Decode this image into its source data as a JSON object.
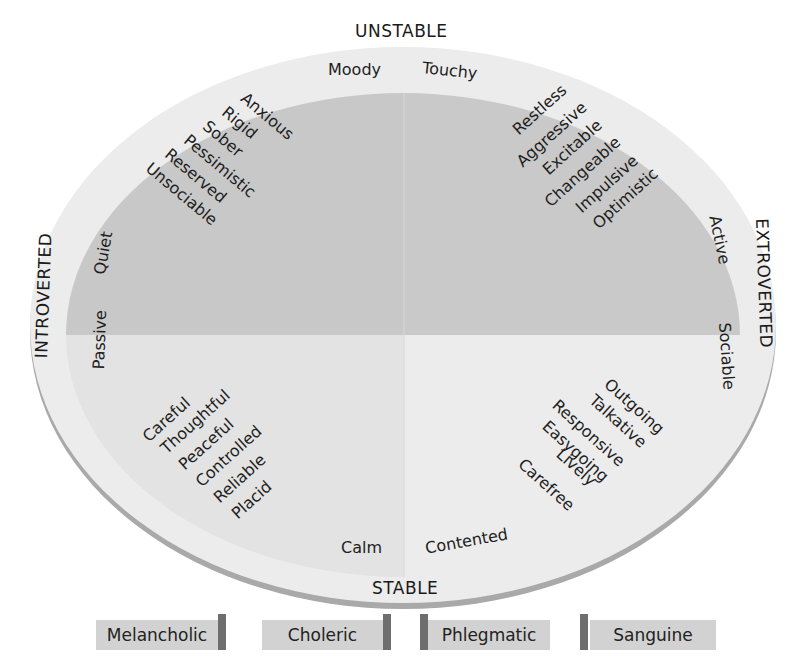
{
  "axes": {
    "top": "UNSTABLE",
    "bottom": "STABLE",
    "left": "INTROVERTED",
    "right": "EXTROVERTED"
  },
  "quadrants": [
    {
      "id": "melancholic",
      "position": "top-left",
      "corner_labels": [
        "Moody",
        "Quiet"
      ],
      "traits": [
        "Anxious",
        "Rigid",
        "Sober",
        "Pessimistic",
        "Reserved",
        "Unsociable"
      ]
    },
    {
      "id": "choleric",
      "position": "top-right",
      "corner_labels": [
        "Touchy",
        "Active"
      ],
      "traits": [
        "Restless",
        "Aggressive",
        "Excitable",
        "Changeable",
        "Impulsive",
        "Optimistic"
      ]
    },
    {
      "id": "phlegmatic",
      "position": "bottom-left",
      "corner_labels": [
        "Passive",
        "Calm"
      ],
      "traits": [
        "Careful",
        "Thoughtful",
        "Peaceful",
        "Controlled",
        "Reliable",
        "Placid"
      ]
    },
    {
      "id": "sanguine",
      "position": "bottom-right",
      "corner_labels": [
        "Sociable",
        "Contented"
      ],
      "traits": [
        "Outgoing",
        "Talkative",
        "Responsive",
        "Easygoing",
        "Lively",
        "Carefree"
      ]
    }
  ],
  "legend": [
    "Melancholic",
    "Choleric",
    "Phlegmatic",
    "Sanguine"
  ],
  "colors": {
    "ring": "#ececec",
    "unstable_fill": "#c8c8c8",
    "stable_fill": "#e4e4e4",
    "rim_shadow": "#a9a9a9",
    "legend_box": "#d2d2d2",
    "legend_side": "#6e6e6e"
  }
}
